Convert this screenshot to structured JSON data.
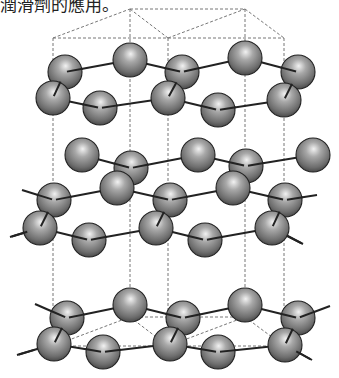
{
  "caption": {
    "text": "潤滑劑的應用。"
  },
  "diagram": {
    "atom_radius": 17,
    "colors": {
      "atom_highlight": "#f2f2f2",
      "atom_mid": "#9a9a9a",
      "atom_shadow": "#4a4a4a",
      "bond": "#222222",
      "unit_cell_dash": "#777777"
    },
    "layers": [
      {
        "name": "top-layer",
        "atoms": [
          [
            65,
            72
          ],
          [
            130,
            60
          ],
          [
            182,
            72
          ],
          [
            245,
            58
          ],
          [
            298,
            72
          ],
          [
            53,
            98
          ],
          [
            100,
            108
          ],
          [
            168,
            98
          ],
          [
            218,
            110
          ],
          [
            284,
            100
          ]
        ],
        "bonds": [
          [
            [
              65,
              72
            ],
            [
              130,
              60
            ]
          ],
          [
            [
              130,
              60
            ],
            [
              182,
              72
            ]
          ],
          [
            [
              182,
              72
            ],
            [
              245,
              58
            ]
          ],
          [
            [
              245,
              58
            ],
            [
              298,
              72
            ]
          ],
          [
            [
              65,
              72
            ],
            [
              53,
              98
            ]
          ],
          [
            [
              182,
              72
            ],
            [
              168,
              98
            ]
          ],
          [
            [
              298,
              72
            ],
            [
              284,
              100
            ]
          ],
          [
            [
              53,
              98
            ],
            [
              100,
              108
            ]
          ],
          [
            [
              100,
              108
            ],
            [
              168,
              98
            ]
          ],
          [
            [
              168,
              98
            ],
            [
              218,
              110
            ]
          ],
          [
            [
              218,
              110
            ],
            [
              284,
              100
            ]
          ]
        ]
      },
      {
        "name": "middle-layer",
        "atoms": [
          [
            82,
            155
          ],
          [
            131,
            168
          ],
          [
            198,
            155
          ],
          [
            246,
            166
          ],
          [
            313,
            155
          ],
          [
            54,
            200
          ],
          [
            117,
            188
          ],
          [
            170,
            200
          ],
          [
            233,
            188
          ],
          [
            285,
            200
          ],
          [
            40,
            228
          ],
          [
            89,
            240
          ],
          [
            156,
            228
          ],
          [
            205,
            240
          ],
          [
            272,
            228
          ]
        ],
        "bonds": [
          [
            [
              82,
              155
            ],
            [
              131,
              168
            ]
          ],
          [
            [
              131,
              168
            ],
            [
              198,
              155
            ]
          ],
          [
            [
              198,
              155
            ],
            [
              246,
              166
            ]
          ],
          [
            [
              246,
              166
            ],
            [
              313,
              155
            ]
          ],
          [
            [
              22,
              190
            ],
            [
              54,
              200
            ]
          ],
          [
            [
              54,
              200
            ],
            [
              117,
              188
            ]
          ],
          [
            [
              117,
              188
            ],
            [
              170,
              200
            ]
          ],
          [
            [
              170,
              200
            ],
            [
              233,
              188
            ]
          ],
          [
            [
              233,
              188
            ],
            [
              285,
              200
            ]
          ],
          [
            [
              285,
              200
            ],
            [
              317,
              195
            ]
          ],
          [
            [
              54,
              200
            ],
            [
              40,
              228
            ]
          ],
          [
            [
              170,
              200
            ],
            [
              156,
              228
            ]
          ],
          [
            [
              285,
              200
            ],
            [
              272,
              228
            ]
          ],
          [
            [
              10,
              237
            ],
            [
              40,
              228
            ]
          ],
          [
            [
              40,
              228
            ],
            [
              89,
              240
            ]
          ],
          [
            [
              89,
              240
            ],
            [
              156,
              228
            ]
          ],
          [
            [
              156,
              228
            ],
            [
              205,
              240
            ]
          ],
          [
            [
              205,
              240
            ],
            [
              272,
              228
            ]
          ],
          [
            [
              272,
              228
            ],
            [
              303,
              244
            ]
          ]
        ]
      },
      {
        "name": "bottom-layer",
        "atoms": [
          [
            67,
            318
          ],
          [
            130,
            305
          ],
          [
            183,
            318
          ],
          [
            245,
            305
          ],
          [
            298,
            318
          ],
          [
            54,
            344
          ],
          [
            103,
            352
          ],
          [
            170,
            344
          ],
          [
            218,
            352
          ],
          [
            285,
            345
          ]
        ],
        "bonds": [
          [
            [
              35,
              304
            ],
            [
              67,
              318
            ]
          ],
          [
            [
              67,
              318
            ],
            [
              130,
              305
            ]
          ],
          [
            [
              130,
              305
            ],
            [
              183,
              318
            ]
          ],
          [
            [
              183,
              318
            ],
            [
              245,
              305
            ]
          ],
          [
            [
              245,
              305
            ],
            [
              298,
              318
            ]
          ],
          [
            [
              298,
              318
            ],
            [
              330,
              306
            ]
          ],
          [
            [
              67,
              318
            ],
            [
              54,
              344
            ]
          ],
          [
            [
              183,
              318
            ],
            [
              170,
              344
            ]
          ],
          [
            [
              298,
              318
            ],
            [
              285,
              345
            ]
          ],
          [
            [
              17,
              355
            ],
            [
              54,
              344
            ]
          ],
          [
            [
              54,
              344
            ],
            [
              103,
              352
            ]
          ],
          [
            [
              103,
              352
            ],
            [
              170,
              344
            ]
          ],
          [
            [
              170,
              344
            ],
            [
              218,
              352
            ]
          ],
          [
            [
              218,
              352
            ],
            [
              285,
              345
            ]
          ],
          [
            [
              285,
              345
            ],
            [
              312,
              360
            ]
          ]
        ]
      }
    ],
    "unit_cell": {
      "top_face": [
        [
          [
            53,
            38
          ],
          [
            130,
            9
          ]
        ],
        [
          [
            130,
            9
          ],
          [
            168,
            38
          ]
        ],
        [
          [
            168,
            38
          ],
          [
            245,
            9
          ]
        ],
        [
          [
            245,
            9
          ],
          [
            284,
            38
          ]
        ],
        [
          [
            130,
            9
          ],
          [
            245,
            9
          ]
        ],
        [
          [
            53,
            38
          ],
          [
            284,
            38
          ]
        ]
      ],
      "bottom_face": [
        [
          [
            53,
            346
          ],
          [
            130,
            317
          ]
        ],
        [
          [
            130,
            317
          ],
          [
            168,
            346
          ]
        ],
        [
          [
            168,
            346
          ],
          [
            245,
            317
          ]
        ],
        [
          [
            245,
            317
          ],
          [
            284,
            346
          ]
        ],
        [
          [
            130,
            317
          ],
          [
            245,
            317
          ]
        ],
        [
          [
            53,
            346
          ],
          [
            284,
            346
          ]
        ]
      ],
      "verticals_x": [
        53,
        130,
        168,
        245,
        284
      ],
      "top_y": [
        38,
        9,
        38,
        9,
        38
      ],
      "bottom_y": [
        346,
        317,
        346,
        317,
        346
      ]
    }
  }
}
